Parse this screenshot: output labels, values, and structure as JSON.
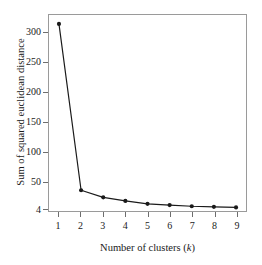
{
  "chart_data": {
    "type": "line",
    "title": "",
    "subtitle": "",
    "xlabel_text": "Number of clusters (",
    "xlabel_italic": "k",
    "xlabel_tail": ")",
    "xlabel": "Number of clusters (k)",
    "ylabel": "Sum of squared euclidean distance",
    "x": [
      1,
      2,
      3,
      4,
      5,
      6,
      7,
      8,
      9
    ],
    "values": [
      315,
      35,
      23,
      17,
      12,
      10,
      8,
      7,
      6
    ],
    "series": [
      {
        "name": "Sum of squared euclidean distance",
        "values": [
          315,
          35,
          23,
          17,
          12,
          10,
          8,
          7,
          6
        ]
      }
    ],
    "xticks": [
      "1",
      "2",
      "3",
      "4",
      "5",
      "6",
      "7",
      "8",
      "9"
    ],
    "yticks": [
      "4",
      "50",
      "100",
      "150",
      "200",
      "250",
      "300"
    ],
    "ytick_values": [
      4,
      50,
      100,
      150,
      200,
      250,
      300
    ],
    "xlim": [
      0.55,
      9.45
    ],
    "ylim": [
      0,
      330
    ],
    "grid": false,
    "legend": "none",
    "marker": "filled-circle",
    "line_color": "#1a1a1a",
    "marker_color": "#1a1a1a",
    "frame_color": "#9a9a9a",
    "background_color": "#ffffff"
  }
}
